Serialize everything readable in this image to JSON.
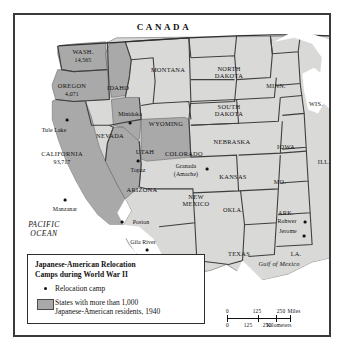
{
  "figure": {
    "title": "Japanese-American Relocation Camps during World War II",
    "frame_color": "#3a3a3a",
    "land_color": "#d9d9d7",
    "highlight_color": "#a9a9a9",
    "water_color": "#ffffff",
    "background_color": "#f2f2f0"
  },
  "country_labels": [
    {
      "name": "canada",
      "text": "CANADA"
    }
  ],
  "water_labels": [
    {
      "name": "pacific-ocean",
      "line1": "PACIFIC",
      "line2": "OCEAN"
    },
    {
      "name": "gulf-of-mexico",
      "text": "Gulf of Mexico"
    }
  ],
  "states": [
    {
      "name": "washington",
      "label": "WASH.",
      "population": "14,565",
      "highlighted": true
    },
    {
      "name": "oregon",
      "label": "OREGON",
      "population": "4,071",
      "highlighted": true
    },
    {
      "name": "california",
      "label": "CALIFORNIA",
      "population": "93,717",
      "highlighted": true
    },
    {
      "name": "idaho",
      "label": "IDAHO",
      "population": "",
      "highlighted": true
    },
    {
      "name": "nevada",
      "label": "NEVADA",
      "population": "",
      "highlighted": false
    },
    {
      "name": "utah",
      "label": "UTAH",
      "population": "",
      "highlighted": true
    },
    {
      "name": "arizona",
      "label": "ARIZONA",
      "population": "",
      "highlighted": true
    },
    {
      "name": "montana",
      "label": "MONTANA",
      "population": "",
      "highlighted": false
    },
    {
      "name": "wyoming",
      "label": "WYOMING",
      "population": "",
      "highlighted": false
    },
    {
      "name": "colorado",
      "label": "COLORADO",
      "population": "",
      "highlighted": true
    },
    {
      "name": "new-mexico",
      "label": "NEW MEXICO",
      "population": "",
      "highlighted": false
    },
    {
      "name": "north-dakota",
      "label": "NORTH DAKOTA",
      "population": "",
      "highlighted": false
    },
    {
      "name": "south-dakota",
      "label": "SOUTH DAKOTA",
      "population": "",
      "highlighted": false
    },
    {
      "name": "nebraska",
      "label": "NEBRASKA",
      "population": "",
      "highlighted": false
    },
    {
      "name": "kansas",
      "label": "KANSAS",
      "population": "",
      "highlighted": false
    },
    {
      "name": "oklahoma",
      "label": "OKLA.",
      "population": "",
      "highlighted": false
    },
    {
      "name": "texas",
      "label": "TEXAS",
      "population": "",
      "highlighted": false
    },
    {
      "name": "minnesota",
      "label": "MINN.",
      "population": "",
      "highlighted": false
    },
    {
      "name": "iowa",
      "label": "IOWA",
      "population": "",
      "highlighted": false
    },
    {
      "name": "missouri",
      "label": "MO.",
      "population": "",
      "highlighted": false
    },
    {
      "name": "arkansas",
      "label": "ARK.",
      "population": "",
      "highlighted": false
    },
    {
      "name": "louisiana",
      "label": "LA.",
      "population": "",
      "highlighted": false
    },
    {
      "name": "wisconsin",
      "label": "WIS.",
      "population": "",
      "highlighted": false
    },
    {
      "name": "illinois",
      "label": "ILL.",
      "population": "",
      "highlighted": false
    }
  ],
  "camps": [
    {
      "name": "tule-lake",
      "label": "Tule Lake",
      "state": "California"
    },
    {
      "name": "manzanar",
      "label": "Manzanar",
      "state": "California"
    },
    {
      "name": "minidoka",
      "label": "Minidoka",
      "state": "Idaho"
    },
    {
      "name": "topaz",
      "label": "Topaz",
      "state": "Utah"
    },
    {
      "name": "poston",
      "label": "Poston",
      "state": "Arizona"
    },
    {
      "name": "gila-river",
      "label": "Gila River",
      "state": "Arizona"
    },
    {
      "name": "granada",
      "label": "Granada",
      "label2": "(Amache)",
      "state": "Colorado"
    },
    {
      "name": "rohwer",
      "label": "Rohwer",
      "state": "Arkansas"
    },
    {
      "name": "jerome",
      "label": "Jerome",
      "state": "Arkansas"
    }
  ],
  "legend": {
    "title_line1": "Japanese-American Relocation",
    "title_line2": "Camps during World War II",
    "camp_entry": "Relocation camp",
    "states_entry_line1": "States with more than 1,000",
    "states_entry_line2": "Japanese-American residents, 1940"
  },
  "scale": {
    "miles": {
      "zero": "0",
      "mid": "125",
      "max": "250",
      "unit": "Miles"
    },
    "kilometers": {
      "zero": "0",
      "mid": "125",
      "max2": "250",
      "unit": "Kilometers"
    }
  }
}
